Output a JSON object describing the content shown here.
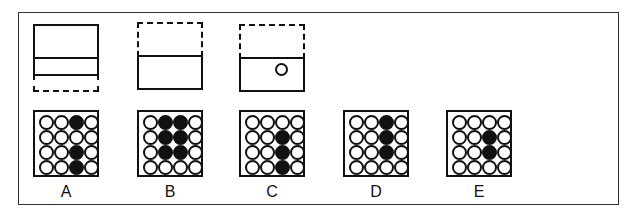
{
  "question_figures": [
    {
      "name": "figure-1",
      "description": "solid rectangle with horizontal divider, dashed extension below"
    },
    {
      "name": "figure-2",
      "description": "dashed rectangle above solid rectangle"
    },
    {
      "name": "figure-3",
      "description": "dashed rectangle above solid rectangle containing small circle"
    }
  ],
  "options": [
    {
      "label": "A",
      "grid": [
        [
          0,
          0,
          1,
          0
        ],
        [
          0,
          0,
          0,
          0
        ],
        [
          0,
          0,
          1,
          0
        ],
        [
          0,
          0,
          1,
          0
        ]
      ]
    },
    {
      "label": "B",
      "grid": [
        [
          0,
          1,
          1,
          0
        ],
        [
          0,
          1,
          1,
          0
        ],
        [
          0,
          1,
          1,
          0
        ],
        [
          0,
          0,
          0,
          0
        ]
      ]
    },
    {
      "label": "C",
      "grid": [
        [
          0,
          0,
          0,
          0
        ],
        [
          0,
          0,
          1,
          0
        ],
        [
          0,
          0,
          1,
          0
        ],
        [
          0,
          0,
          1,
          0
        ]
      ]
    },
    {
      "label": "D",
      "grid": [
        [
          0,
          0,
          1,
          0
        ],
        [
          0,
          0,
          1,
          0
        ],
        [
          0,
          0,
          1,
          0
        ],
        [
          0,
          0,
          0,
          0
        ]
      ]
    },
    {
      "label": "E",
      "grid": [
        [
          0,
          0,
          0,
          0
        ],
        [
          0,
          0,
          1,
          0
        ],
        [
          0,
          0,
          1,
          0
        ],
        [
          0,
          0,
          0,
          0
        ]
      ]
    }
  ],
  "colors": {
    "ink": "#111111",
    "background": "#ffffff"
  }
}
